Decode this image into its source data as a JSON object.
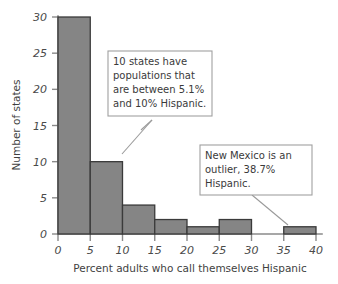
{
  "chart_data": {
    "type": "bar",
    "title": "",
    "xlabel": "Percent adults who call themselves Hispanic",
    "ylabel": "Number of states",
    "xlim": [
      0,
      40
    ],
    "ylim": [
      0,
      30
    ],
    "grid": false,
    "legend": "none",
    "bin_width": 5,
    "categories": [
      "0-5",
      "5-10",
      "10-15",
      "15-20",
      "20-25",
      "25-30",
      "30-35",
      "35-40"
    ],
    "bin_starts": [
      0,
      5,
      10,
      15,
      20,
      25,
      30,
      35
    ],
    "values": [
      30,
      10,
      4,
      2,
      1,
      2,
      0,
      1
    ],
    "xticks": [
      "0",
      "5",
      "10",
      "15",
      "20",
      "25",
      "30",
      "35",
      "40"
    ],
    "xtick_values": [
      0,
      5,
      10,
      15,
      20,
      25,
      30,
      35,
      40
    ],
    "yticks": [
      "0",
      "5",
      "10",
      "15",
      "20",
      "25",
      "30"
    ],
    "ytick_values": [
      0,
      5,
      10,
      15,
      20,
      25,
      30
    ],
    "annotations": [
      {
        "id": "bin-5-10-callout",
        "lines": [
          "10 states have",
          "populations that",
          "are between 5.1%",
          "and 10% Hispanic."
        ],
        "points_to_bin": "5-10"
      },
      {
        "id": "new-mexico-callout",
        "lines": [
          "New Mexico is an",
          "outlier, 38.7%",
          "Hispanic."
        ],
        "points_to_bin": "35-40"
      }
    ],
    "colors": {
      "bar_fill": "#858585",
      "bar_stroke": "#3a3a3a",
      "axis": "#8a8a8a",
      "text": "#3a3a3a",
      "callout_border": "#a0a0a0",
      "background": "#ffffff"
    }
  }
}
